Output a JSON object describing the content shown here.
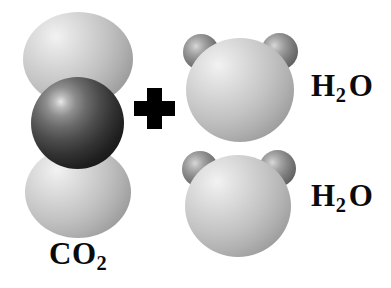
{
  "figure": {
    "background_color": "#ffffff",
    "width": 391,
    "height": 288
  },
  "operator": {
    "name": "plus",
    "symbol": "+",
    "color": "#000000"
  },
  "labels": {
    "co2": {
      "text": "CO",
      "subscript": "2",
      "full": "CO2"
    },
    "h2o_top": {
      "text": "H",
      "subscript": "2",
      "tail": "O",
      "full": "H2O"
    },
    "h2o_bottom": {
      "text": "H",
      "subscript": "2",
      "tail": "O",
      "full": "H2O"
    }
  },
  "molecules": [
    {
      "name": "carbon-dioxide",
      "formula": "CO2",
      "atoms": [
        {
          "element": "O",
          "role": "oxygen-top",
          "color": "#c2c2c2"
        },
        {
          "element": "C",
          "role": "carbon-center",
          "color": "#1f1f1f"
        },
        {
          "element": "O",
          "role": "oxygen-bottom",
          "color": "#c2c2c2"
        }
      ]
    },
    {
      "name": "water-top",
      "formula": "H2O",
      "atoms": [
        {
          "element": "O",
          "role": "oxygen",
          "color": "#c2c2c2"
        },
        {
          "element": "H",
          "role": "hydrogen-left",
          "color": "#757575"
        },
        {
          "element": "H",
          "role": "hydrogen-right",
          "color": "#757575"
        }
      ]
    },
    {
      "name": "water-bottom",
      "formula": "H2O",
      "atoms": [
        {
          "element": "O",
          "role": "oxygen",
          "color": "#c2c2c2"
        },
        {
          "element": "H",
          "role": "hydrogen-left",
          "color": "#757575"
        },
        {
          "element": "H",
          "role": "hydrogen-right",
          "color": "#757575"
        }
      ]
    }
  ]
}
